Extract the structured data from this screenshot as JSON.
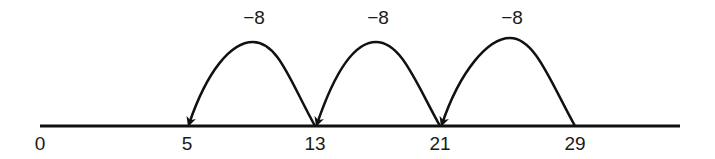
{
  "diagram": {
    "type": "number-line-jumps",
    "line": {
      "x1": 40,
      "x2": 680,
      "y": 126,
      "color": "#111111"
    },
    "ticks": [
      {
        "value": "0",
        "x": 40
      },
      {
        "value": "5",
        "x": 187
      },
      {
        "value": "13",
        "x": 315
      },
      {
        "value": "21",
        "x": 440
      },
      {
        "value": "29",
        "x": 575
      }
    ],
    "jumps": [
      {
        "label": "−8",
        "from": "13",
        "to": "5",
        "from_x": 315,
        "to_x": 187,
        "peak_x": 253,
        "peak_y": 42,
        "label_x": 254
      },
      {
        "label": "−8",
        "from": "21",
        "to": "13",
        "from_x": 440,
        "to_x": 315,
        "peak_x": 376,
        "peak_y": 42,
        "label_x": 378
      },
      {
        "label": "−8",
        "from": "29",
        "to": "21",
        "from_x": 575,
        "to_x": 440,
        "peak_x": 510,
        "peak_y": 38,
        "label_x": 512
      }
    ]
  }
}
